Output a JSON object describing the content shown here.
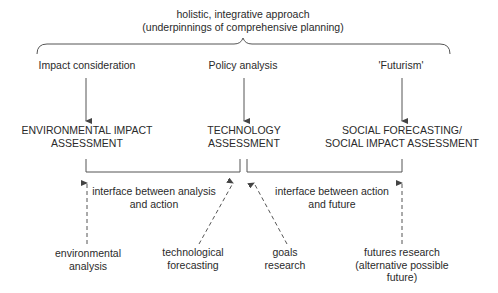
{
  "diagram": {
    "top": {
      "line1": "holistic, integrative approach",
      "line2": "(underpinnings of comprehensive planning)"
    },
    "approaches": [
      {
        "label": "Impact consideration"
      },
      {
        "label": "Policy analysis"
      },
      {
        "label": "'Futurism'"
      }
    ],
    "assessments": [
      {
        "line1": "ENVIRONMENTAL IMPACT",
        "line2": "ASSESSMENT"
      },
      {
        "line1": "TECHNOLOGY",
        "line2": "ASSESSMENT"
      },
      {
        "line1": "SOCIAL FORECASTING/",
        "line2": "SOCIAL IMPACT ASSESSMENT"
      }
    ],
    "interfaces": [
      {
        "line1": "interface between analysis",
        "line2": "and action"
      },
      {
        "line1": "interface between action",
        "line2": "and future"
      }
    ],
    "inputs": [
      {
        "line1": "environmental",
        "line2": "analysis"
      },
      {
        "line1": "technological",
        "line2": "forecasting"
      },
      {
        "line1": "goals",
        "line2": "research"
      },
      {
        "line1": "futures research",
        "line2": "(alternative possible",
        "line3": "future)"
      }
    ],
    "colors": {
      "line": "#555555",
      "text": "#2a2a2a"
    }
  }
}
